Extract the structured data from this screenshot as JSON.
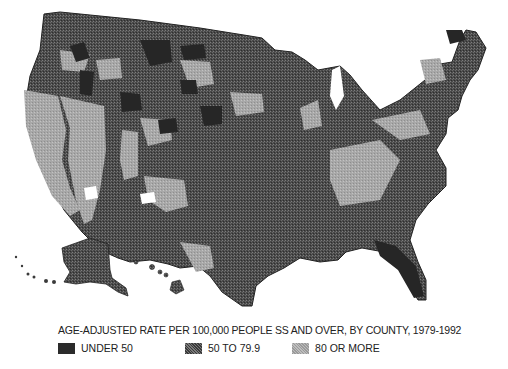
{
  "map": {
    "title": "AGE-ADJUSTED RATE PER 100,000 PEOPLE SS AND OVER, BY COUNTY, 1979-1992",
    "region": "United States (contiguous, Alaska, Hawaii)",
    "colors": {
      "under_50": "#2b2b2b",
      "50_to_79_9": "#5a5a5a",
      "80_or_more": "#ababab",
      "no_data": "#ffffff"
    }
  },
  "legend": {
    "items": [
      {
        "label": "UNDER 50",
        "swatch": "dark"
      },
      {
        "label": "50 TO 79.9",
        "swatch": "mid"
      },
      {
        "label": "80 OR MORE",
        "swatch": "light"
      }
    ]
  }
}
